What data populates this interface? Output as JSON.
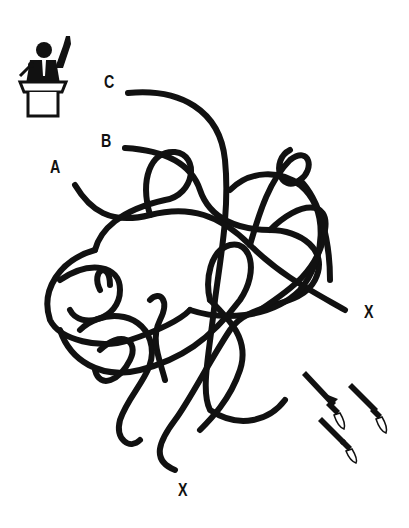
{
  "puzzle": {
    "type": "tangled-lines-maze",
    "start_labels": [
      "A",
      "B",
      "C"
    ],
    "end_labels": [
      "X",
      "X"
    ],
    "icons": {
      "speaker": "politician-at-podium-icon",
      "missiles": "missiles-launch-icon"
    },
    "colors": {
      "line": "#111111",
      "background": "#ffffff"
    }
  }
}
